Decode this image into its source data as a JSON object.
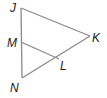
{
  "diagram": {
    "type": "triangle",
    "line_color": "#8a8a8a",
    "label_color": "#222222",
    "points": {
      "J": {
        "label": "J",
        "x": 21,
        "y": 8
      },
      "K": {
        "label": "K",
        "x": 90,
        "y": 36
      },
      "N": {
        "label": "N",
        "x": 22,
        "y": 78
      },
      "M": {
        "label": "M",
        "x": 21,
        "y": 42
      },
      "L": {
        "label": "L",
        "x": 59,
        "y": 59
      }
    },
    "segments": [
      [
        "J",
        "K"
      ],
      [
        "J",
        "N"
      ],
      [
        "N",
        "K"
      ],
      [
        "M",
        "L"
      ]
    ]
  }
}
